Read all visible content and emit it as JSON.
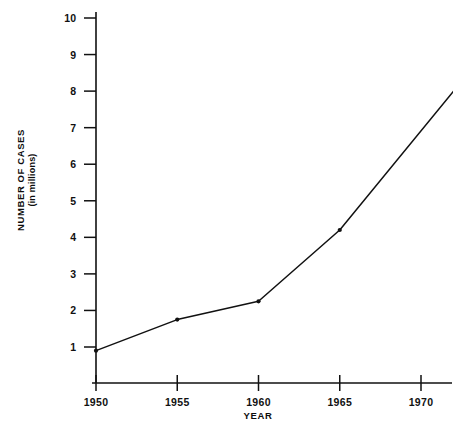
{
  "chart_data": {
    "type": "line",
    "title": "",
    "xlabel": "YEAR",
    "ylabel": "NUMBER OF CASES",
    "ylabel_sub": "(in millions)",
    "x": [
      1950,
      1955,
      1960,
      1965,
      1972
    ],
    "values": [
      0.9,
      1.75,
      2.25,
      4.2,
      8.0
    ],
    "series": [
      {
        "name": "Number of cases",
        "values": [
          0.9,
          1.75,
          2.25,
          4.2,
          8.0
        ]
      }
    ],
    "xtick_labels": [
      "1950",
      "1955",
      "1960",
      "1965",
      "1970"
    ],
    "xticks": [
      1950,
      1955,
      1960,
      1965,
      1970
    ],
    "ytick_labels": [
      "1",
      "2",
      "3",
      "4",
      "5",
      "6",
      "7",
      "8",
      "9",
      "10"
    ],
    "yticks": [
      1,
      2,
      3,
      4,
      5,
      6,
      7,
      8,
      9,
      10
    ],
    "xlim": [
      1950,
      1972.5
    ],
    "ylim": [
      0,
      10.5
    ],
    "grid": false,
    "legend": "none",
    "markers": [
      "1950",
      "1955",
      "1960",
      "1965"
    ],
    "line_color": "#111111",
    "marker_color": "#111111",
    "background_color": "#ffffff"
  }
}
